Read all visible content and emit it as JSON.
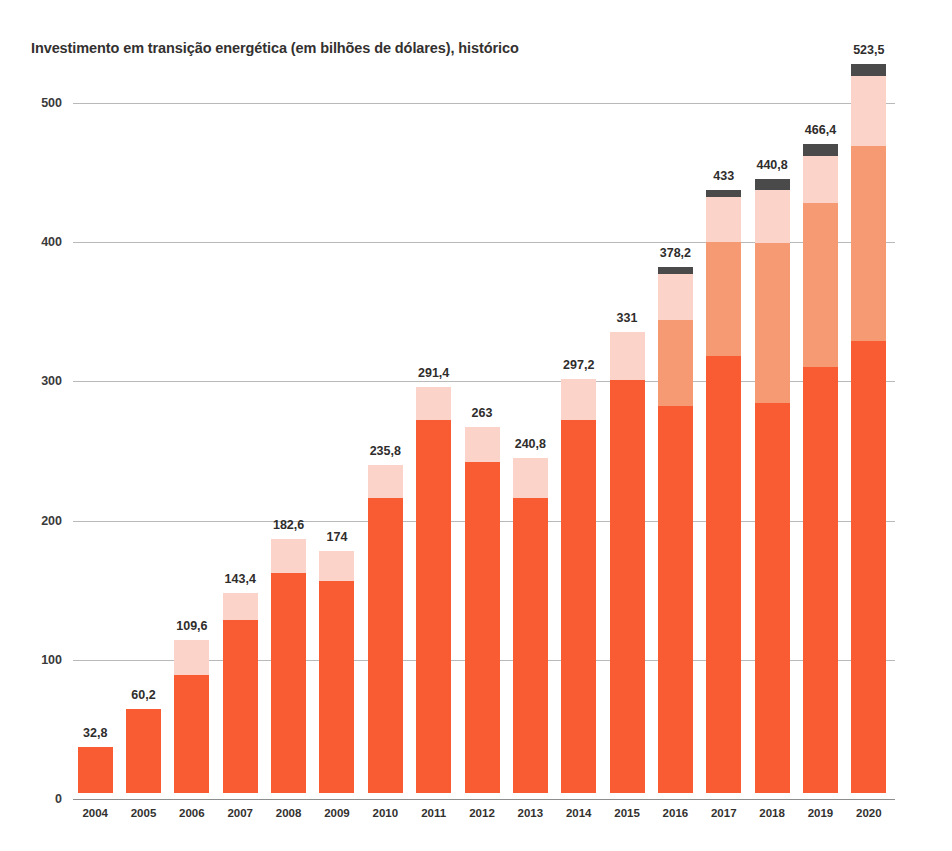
{
  "chart_data": {
    "type": "bar",
    "subtype": "stacked-vertical",
    "title": "Investimento em transição energética (em bilhões de dólares), histórico",
    "xlabel": "",
    "ylabel": "",
    "ylim": [
      0,
      540
    ],
    "yticks": [
      0,
      100,
      200,
      300,
      400,
      500
    ],
    "ytick_labels": [
      "0",
      "100",
      "200",
      "300",
      "400",
      "500"
    ],
    "grid": "horizontal",
    "legend": "none",
    "decimal_separator": ",",
    "categories": [
      "2004",
      "2005",
      "2006",
      "2007",
      "2008",
      "2009",
      "2010",
      "2011",
      "2012",
      "2013",
      "2014",
      "2015",
      "2016",
      "2017",
      "2018",
      "2019",
      "2020"
    ],
    "totals": [
      32.8,
      60.2,
      109.6,
      143.4,
      182.6,
      174,
      235.8,
      291.4,
      263,
      240.8,
      297.2,
      331,
      378.2,
      433,
      440.8,
      466.4,
      523.5
    ],
    "total_labels": [
      "32,8",
      "60,2",
      "109,6",
      "143,4",
      "182,6",
      "174",
      "235,8",
      "291,4",
      "263",
      "240,8",
      "297,2",
      "331",
      "378,2",
      "433",
      "440,8",
      "466,4",
      "523,5"
    ],
    "series": [
      {
        "name": "segmento-1-laranja",
        "color": "#F95C32",
        "values": [
          32.8,
          60.2,
          85.0,
          124.0,
          158.0,
          152.0,
          212.0,
          268.0,
          238.0,
          212.0,
          268.0,
          297.0,
          278.0,
          314.0,
          280.0,
          306.0,
          325.0
        ]
      },
      {
        "name": "segmento-2-salmao",
        "color": "#F59A72",
        "values": [
          0,
          0,
          0,
          0,
          0,
          0,
          0,
          0,
          0,
          0,
          0,
          0,
          62.0,
          82.0,
          115.0,
          118.0,
          140.0
        ]
      },
      {
        "name": "segmento-3-rosa-claro",
        "color": "#FBD3C8",
        "values": [
          0,
          0,
          24.6,
          19.4,
          24.6,
          22.0,
          23.8,
          23.4,
          25.0,
          28.8,
          29.2,
          34.0,
          33.2,
          32.0,
          38.0,
          34.0,
          50.0
        ]
      },
      {
        "name": "segmento-4-cinza-escuro",
        "color": "#4A4A4A",
        "values": [
          0,
          0,
          0,
          0,
          0,
          0,
          0,
          0,
          0,
          0,
          0,
          0,
          5.0,
          5.0,
          7.8,
          8.4,
          8.5
        ]
      }
    ]
  },
  "caption": ""
}
